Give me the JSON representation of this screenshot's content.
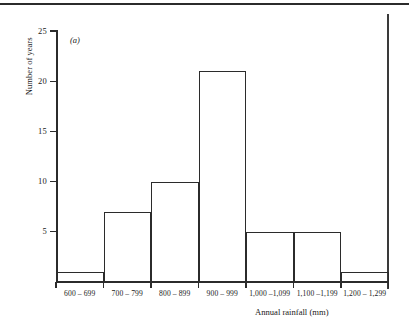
{
  "figure": {
    "panel_label": "(a)"
  },
  "chart_data": {
    "type": "bar",
    "title": "",
    "subtitle": "",
    "xlabel": "Annual rainfall (mm)",
    "ylabel": "Number of years",
    "categories": [
      "600 – 699",
      "700 – 799",
      "800 – 899",
      "900 – 999",
      "1,000 –1,099",
      "1,100 –1,199",
      "1,200 – 1,299"
    ],
    "values": [
      1,
      7,
      10,
      21,
      5,
      5,
      1
    ],
    "ylim": [
      0,
      25
    ],
    "ytick_labels": [
      "25",
      "20",
      "15",
      "10",
      "5"
    ],
    "ytick_values": [
      25,
      20,
      15,
      10,
      5
    ],
    "grid": false,
    "legend": null,
    "style": "histogram, unfilled bars with black outline"
  }
}
